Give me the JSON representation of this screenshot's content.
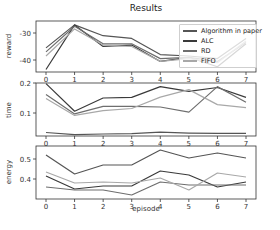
{
  "chart_data": {
    "type": "line",
    "title": "Results",
    "xlabel": "episode",
    "x": [
      0,
      1,
      2,
      3,
      4,
      5,
      6,
      7
    ],
    "xticks": [
      "0",
      "1",
      "2",
      "3",
      "4",
      "5",
      "6",
      "7"
    ],
    "legend": {
      "position": "upper right (top panel)",
      "entries": [
        "Algorithm in paper",
        "ALC",
        "RD",
        "FIFO"
      ]
    },
    "grid": false,
    "panels": [
      {
        "ylabel": "reward",
        "yticks": [
          "-30",
          "-40"
        ],
        "ylim": [
          -44.5,
          -25.5
        ],
        "series": [
          {
            "name": "Algorithm in paper",
            "values": [
              -35.5,
              -27.0,
              -31.0,
              -32.0,
              -38.0,
              -38.5,
              -39.5,
              -32.0
            ]
          },
          {
            "name": "ALC",
            "values": [
              -43.5,
              -27.0,
              -35.0,
              -34.5,
              -40.5,
              -39.0,
              -42.5,
              -34.0
            ]
          },
          {
            "name": "RD",
            "values": [
              -37.0,
              -27.5,
              -34.0,
              -34.0,
              -39.5,
              -39.0,
              -40.5,
              -33.5
            ]
          },
          {
            "name": "FIFO",
            "values": [
              -38.5,
              -28.5,
              -34.5,
              -35.0,
              -40.5,
              -39.5,
              -41.0,
              -33.0
            ]
          }
        ]
      },
      {
        "ylabel": "time",
        "yticks": [
          "0.2",
          "0.1"
        ],
        "ylim": [
          0.02,
          0.2
        ],
        "series": [
          {
            "name": "Algorithm in paper",
            "values": [
              0.035,
              0.028,
              0.03,
              0.031,
              0.036,
              0.033,
              0.032,
              0.032
            ]
          },
          {
            "name": "ALC",
            "values": [
              0.198,
              0.106,
              0.15,
              0.152,
              0.188,
              0.172,
              0.185,
              0.152
            ]
          },
          {
            "name": "RD",
            "values": [
              0.162,
              0.097,
              0.122,
              0.122,
              0.12,
              0.103,
              0.188,
              0.136
            ]
          },
          {
            "name": "FIFO",
            "values": [
              0.148,
              0.092,
              0.108,
              0.115,
              0.153,
              0.178,
              0.128,
              0.118
            ]
          }
        ]
      },
      {
        "ylabel": "energy",
        "yticks": [
          "0.5",
          "0.4"
        ],
        "ylim": [
          0.315,
          0.555
        ],
        "series": [
          {
            "name": "Algorithm in paper",
            "values": [
              0.52,
              0.425,
              0.47,
              0.47,
              0.545,
              0.505,
              0.53,
              0.505
            ]
          },
          {
            "name": "ALC",
            "values": [
              0.415,
              0.35,
              0.365,
              0.365,
              0.44,
              0.42,
              0.36,
              0.385
            ]
          },
          {
            "name": "RD",
            "values": [
              0.36,
              0.345,
              0.345,
              0.32,
              0.385,
              0.37,
              0.37,
              0.37
            ]
          },
          {
            "name": "FIFO",
            "values": [
              0.435,
              0.38,
              0.385,
              0.38,
              0.405,
              0.345,
              0.43,
              0.41
            ]
          }
        ]
      }
    ]
  },
  "colors": {
    "Algorithm in paper": "#555555",
    "ALC": "#3a3a3a",
    "RD": "#6e6e6e",
    "FIFO": "#a8a8a8",
    "axis": "#333333"
  }
}
